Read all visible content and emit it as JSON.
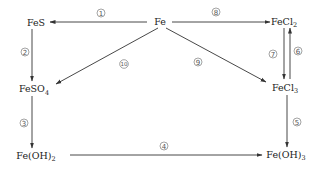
{
  "diagram": {
    "type": "reaction-network",
    "colors": {
      "line": "#333333",
      "text": "#222222",
      "background": "#ffffff"
    },
    "nodes": {
      "fes": {
        "label": "FeS",
        "main": "FeS",
        "sub": ""
      },
      "fe": {
        "label": "Fe",
        "main": "Fe",
        "sub": ""
      },
      "fecl2": {
        "label": "FeCl₂",
        "main": "FeCl",
        "sub": "2"
      },
      "feso4": {
        "label": "FeSO₄",
        "main": "FeSO",
        "sub": "4"
      },
      "fecl3": {
        "label": "FeCl₃",
        "main": "FeCl",
        "sub": "3"
      },
      "feoh2": {
        "label": "Fe(OH)₂",
        "main": "Fe(OH)",
        "sub": "2"
      },
      "feoh3": {
        "label": "Fe(OH)₃",
        "main": "Fe(OH)",
        "sub": "3"
      }
    },
    "edges": [
      {
        "id": "1",
        "label": "①",
        "num": "1",
        "from": "Fe",
        "to": "FeS"
      },
      {
        "id": "2",
        "label": "②",
        "num": "2",
        "from": "FeS",
        "to": "FeSO₄"
      },
      {
        "id": "3",
        "label": "③",
        "num": "3",
        "from": "FeSO₄",
        "to": "Fe(OH)₂"
      },
      {
        "id": "4",
        "label": "④",
        "num": "4",
        "from": "Fe(OH)₂",
        "to": "Fe(OH)₃"
      },
      {
        "id": "5",
        "label": "⑤",
        "num": "5",
        "from": "FeCl₃",
        "to": "Fe(OH)₃"
      },
      {
        "id": "6",
        "label": "⑥",
        "num": "6",
        "from": "FeCl₃",
        "to": "FeCl₂"
      },
      {
        "id": "7",
        "label": "⑦",
        "num": "7",
        "from": "FeCl₂",
        "to": "FeCl₃"
      },
      {
        "id": "8",
        "label": "⑧",
        "num": "8",
        "from": "Fe",
        "to": "FeCl₂"
      },
      {
        "id": "9",
        "label": "⑨",
        "num": "9",
        "from": "Fe",
        "to": "FeCl₃"
      },
      {
        "id": "10",
        "label": "⑩",
        "num": "10",
        "from": "Fe",
        "to": "FeSO₄"
      }
    ]
  }
}
